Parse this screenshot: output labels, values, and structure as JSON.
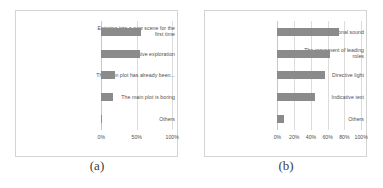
{
  "figure": {
    "panels": [
      {
        "caption": "(a)",
        "label_col_width_pct": 53,
        "chart_data": {
          "type": "bar",
          "orientation": "horizontal",
          "title": "",
          "xlabel": "",
          "ylabel": "",
          "categories": [
            "Entering into a new scene for the first time",
            "Habitual inquisitive exploration",
            "The main plot has already been...",
            "The main plot is boring",
            "Others"
          ],
          "values": [
            56,
            54,
            20,
            17,
            1
          ],
          "xlim": [
            0,
            100
          ],
          "xticks": [
            0,
            50,
            100
          ],
          "xticklabels": [
            "0%",
            "50%",
            "100%"
          ],
          "grid": true,
          "legend": "none",
          "bar_color": "#8b8b8b"
        }
      },
      {
        "caption": "(b)",
        "label_col_width_pct": 45,
        "chart_data": {
          "type": "bar",
          "orientation": "horizontal",
          "title": "",
          "xlabel": "",
          "ylabel": "",
          "categories": [
            "Directional sound",
            "The movement of leading roles",
            "Directive light",
            "Indicative text",
            "Others"
          ],
          "values": [
            74,
            63,
            57,
            45,
            8
          ],
          "xlim": [
            0,
            100
          ],
          "xticks": [
            0,
            20,
            40,
            60,
            80,
            100
          ],
          "xticklabels": [
            "0%",
            "20%",
            "40%",
            "60%",
            "80%",
            "100%"
          ],
          "grid": true,
          "legend": "none",
          "bar_color": "#8b8b8b"
        }
      }
    ]
  }
}
